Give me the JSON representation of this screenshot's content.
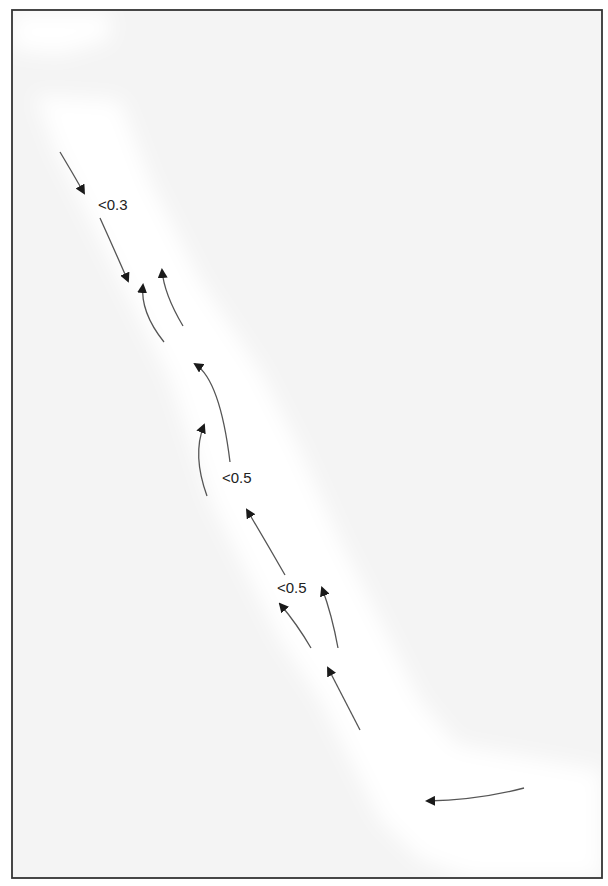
{
  "figure": {
    "frame": {
      "x": 12,
      "y": 10,
      "width": 590,
      "height": 868,
      "stroke": "#333333"
    },
    "colors": {
      "background": "#f4f4f4",
      "channel": "#ffffff",
      "arrow": "#555555",
      "arrowhead": "#1a1a1a",
      "text": "#222222"
    },
    "labels": [
      {
        "text": "<0.3",
        "x": 98,
        "y": 197
      },
      {
        "text": "<0.5",
        "x": 222,
        "y": 470
      },
      {
        "text": "<0.5",
        "x": 277,
        "y": 580
      }
    ],
    "arrows": [
      {
        "id": "a1",
        "from": [
          60,
          152
        ],
        "ctrl": [
          72,
          172
        ],
        "to": [
          84,
          193
        ]
      },
      {
        "id": "a2",
        "from": [
          100,
          218
        ],
        "ctrl": [
          114,
          249
        ],
        "to": [
          128,
          281
        ]
      },
      {
        "id": "a3",
        "from": [
          164,
          342
        ],
        "ctrl": [
          140,
          312
        ],
        "to": [
          143,
          285
        ]
      },
      {
        "id": "a4",
        "from": [
          183,
          326
        ],
        "ctrl": [
          164,
          294
        ],
        "to": [
          162,
          270
        ]
      },
      {
        "id": "a5",
        "from": [
          230,
          462
        ],
        "ctrl": [
          220,
          380
        ],
        "to": [
          195,
          364
        ]
      },
      {
        "id": "a6",
        "from": [
          207,
          496
        ],
        "ctrl": [
          192,
          455
        ],
        "to": [
          204,
          425
        ]
      },
      {
        "id": "a7",
        "from": [
          285,
          575
        ],
        "ctrl": [
          266,
          542
        ],
        "to": [
          247,
          510
        ]
      },
      {
        "id": "a8",
        "from": [
          311,
          648
        ],
        "ctrl": [
          297,
          624
        ],
        "to": [
          280,
          604
        ]
      },
      {
        "id": "a9",
        "from": [
          338,
          648
        ],
        "ctrl": [
          332,
          615
        ],
        "to": [
          322,
          588
        ]
      },
      {
        "id": "a10",
        "from": [
          360,
          730
        ],
        "ctrl": [
          344,
          699
        ],
        "to": [
          328,
          668
        ]
      },
      {
        "id": "a11",
        "from": [
          524,
          788
        ],
        "ctrl": [
          478,
          800
        ],
        "to": [
          427,
          801
        ]
      }
    ]
  }
}
